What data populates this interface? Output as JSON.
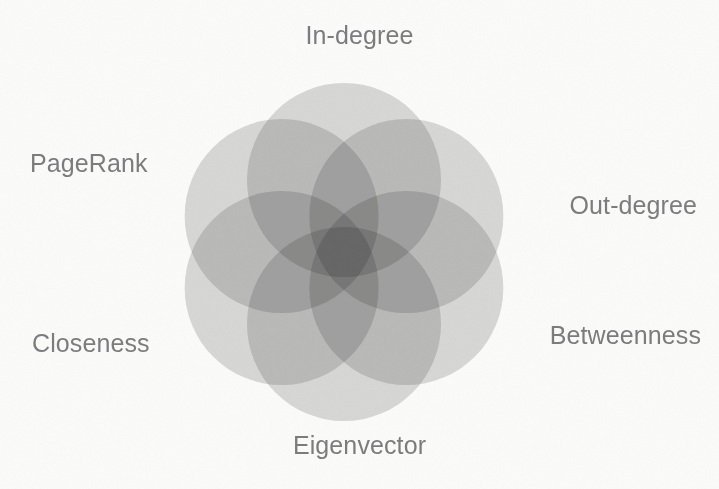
{
  "figure": {
    "background_color": "#fbfbfa",
    "label_color": "#7c7c7c"
  },
  "chart_data": {
    "type": "venn",
    "title": "",
    "subtitle": "",
    "set_count": 6,
    "layout": "radial-rosette",
    "center": {
      "x": 344,
      "y": 252
    },
    "circle_radius": 97,
    "center_offset": 72,
    "blend_mode": "multiply",
    "circle_fill": "#b9b9b9",
    "circle_opacity": 0.52,
    "sets": [
      {
        "id": "in-degree",
        "label": "In-degree",
        "angle_deg": -90,
        "label_position": "top",
        "fill": "#c8c8c8"
      },
      {
        "id": "out-degree",
        "label": "Out-degree",
        "angle_deg": -30,
        "label_position": "upper-right",
        "fill": "#c0c0c0"
      },
      {
        "id": "betweenness",
        "label": "Betweenness",
        "angle_deg": 30,
        "label_position": "lower-right",
        "fill": "#bdbdbd"
      },
      {
        "id": "eigenvector",
        "label": "Eigenvector",
        "angle_deg": 90,
        "label_position": "bottom",
        "fill": "#b5b5b5"
      },
      {
        "id": "closeness",
        "label": "Closeness",
        "angle_deg": 150,
        "label_position": "lower-left",
        "fill": "#b3b3b3"
      },
      {
        "id": "pagerank",
        "label": "PageRank",
        "angle_deg": 210,
        "label_position": "upper-left",
        "fill": "#b8b8b8"
      }
    ],
    "legend": "none",
    "grid": false,
    "axes": false
  },
  "labels": {
    "in_degree": "In-degree",
    "out_degree": "Out-degree",
    "betweenness": "Betweenness",
    "eigenvector": "Eigenvector",
    "closeness": "Closeness",
    "pagerank": "PageRank"
  }
}
